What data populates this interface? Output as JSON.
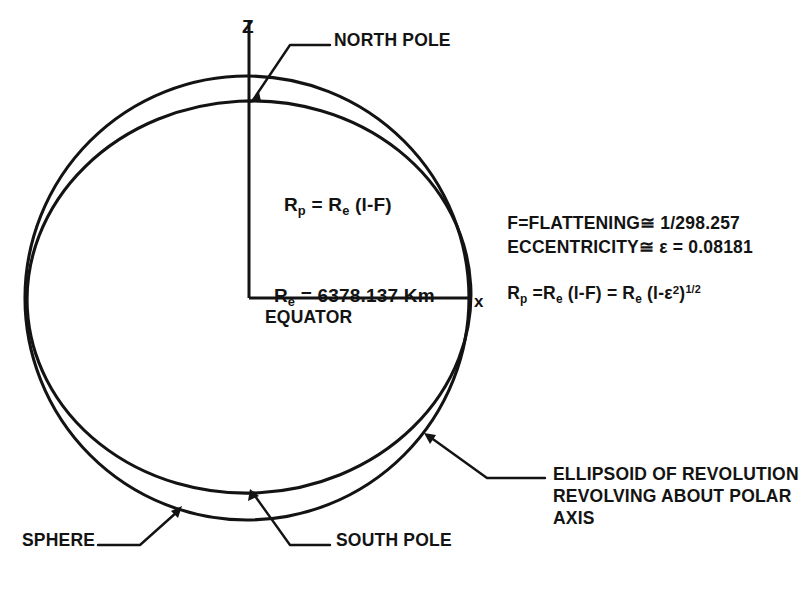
{
  "figure": {
    "title_semantic": "earth-sphere-vs-ellipsoid-geometry-diagram",
    "axes": {
      "z_label": "Z",
      "x_label": "x"
    },
    "callouts": {
      "north_pole": "NORTH POLE",
      "south_pole": "SOUTH POLE",
      "sphere": "SPHERE",
      "equator": "EQUATOR",
      "ellipsoid_line1": "ELLIPSOID OF REVOLUTION",
      "ellipsoid_line2": "REVOLVING ABOUT POLAR",
      "ellipsoid_line3": "AXIS"
    },
    "formulas": {
      "polar_radius": {
        "lhs_base": "R",
        "lhs_sub": "p",
        "eq": " = ",
        "rhs_base": "R",
        "rhs_sub": "e",
        "rhs_tail": " (l-F)"
      },
      "equatorial_radius": {
        "base": "R",
        "sub": "e",
        "eq": " = ",
        "value": "6378.137",
        "unit": "Km"
      },
      "flattening": {
        "name": "F=FLATTENING",
        "approx": "≅",
        "value": "1/298.257"
      },
      "eccentricity": {
        "name": "ECCENTRICITY",
        "approx": "≅",
        "symbol": "ε",
        "eq": " = ",
        "value": "0.08181"
      },
      "combined": {
        "lhs_base": "R",
        "lhs_sub": "p",
        "eq1": " =",
        "m1_base": "R",
        "m1_sub": "e",
        "m1_tail": " (l-F) = ",
        "m2_base": "R",
        "m2_sub": "e",
        "m2_open": " (l-",
        "m2_eps": "ε",
        "m2_sup": "2",
        "m2_close": ")",
        "m2_exp": "1/2"
      }
    },
    "colors": {
      "ink": "#131313",
      "background": "#ffffff"
    }
  }
}
